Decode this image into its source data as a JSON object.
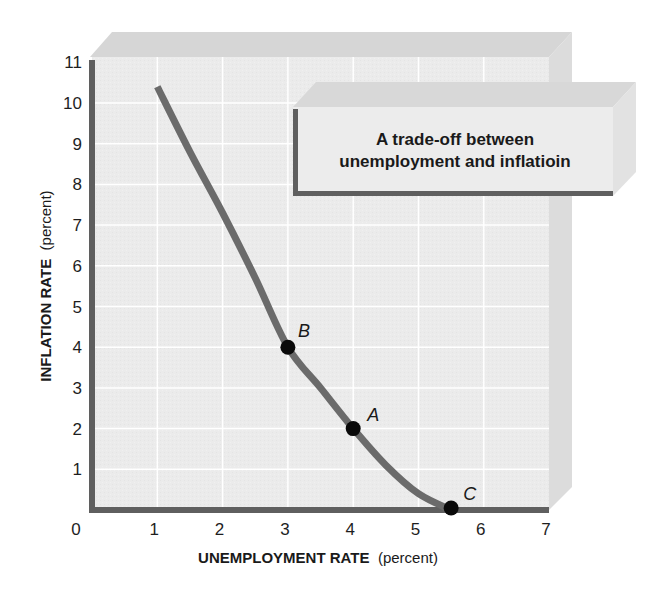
{
  "chart_data": {
    "type": "line",
    "title": "A trade-off between unemployment and inflatioin",
    "title_lines": [
      "A trade-off between",
      "unemployment and inflatioin"
    ],
    "xlabel_bold": "UNEMPLOYMENT RATE",
    "xlabel_unit": "(percent)",
    "ylabel_bold": "INFLATION RATE",
    "ylabel_unit": "(percent)",
    "xlim": [
      0,
      7
    ],
    "ylim": [
      0,
      11
    ],
    "x_ticks": [
      0,
      1,
      2,
      3,
      4,
      5,
      6,
      7
    ],
    "y_ticks": [
      1,
      2,
      3,
      4,
      5,
      6,
      7,
      8,
      9,
      10,
      11
    ],
    "grid": true,
    "legend": null,
    "series": [
      {
        "name": "Phillips curve",
        "x": [
          1.0,
          1.5,
          2.0,
          2.5,
          3.0,
          3.5,
          4.0,
          4.5,
          5.0,
          5.5
        ],
        "y": [
          10.4,
          8.8,
          7.3,
          5.7,
          4.0,
          3.0,
          2.0,
          1.1,
          0.4,
          0.0
        ]
      }
    ],
    "points": [
      {
        "label": "B",
        "x": 3.0,
        "y": 4.0
      },
      {
        "label": "A",
        "x": 4.0,
        "y": 2.0
      },
      {
        "label": "C",
        "x": 5.5,
        "y": 0.0
      }
    ]
  },
  "colors": {
    "plot_background": "#ebebeb",
    "gridline": "#ffffff",
    "axis": "#5f5f5f",
    "curve": "#6b6b6b",
    "point": "#0a0a0a",
    "top_face": "#d6d6d6",
    "side_face": "#dcdcdc",
    "title_box_face": "#ececec"
  }
}
